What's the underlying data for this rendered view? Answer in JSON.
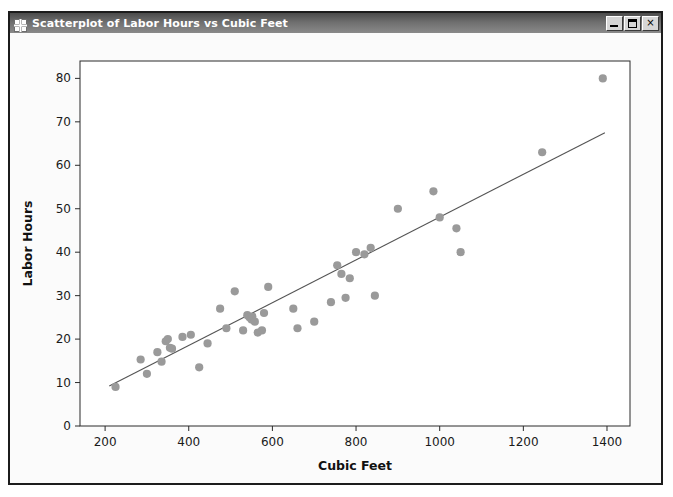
{
  "window": {
    "title": "Scatterplot of Labor Hours vs Cubic Feet",
    "icon": "grid-icon",
    "controls": {
      "minimize_label": "_",
      "maximize_label": "□",
      "close_label": "×"
    },
    "frame_color": "#1c1c1c",
    "titlebar_color": "#6e6e6e",
    "client_color": "#fbfbfb"
  },
  "chart_data": {
    "type": "scatter",
    "title": "Scatter Plot of Labor Hours and Cubic Feet",
    "xlabel": "Cubic Feet",
    "ylabel": "Labor Hours",
    "xlim": [
      140,
      1455
    ],
    "ylim": [
      0,
      84
    ],
    "xticks": [
      200,
      400,
      600,
      800,
      1000,
      1200,
      1400
    ],
    "yticks": [
      0,
      10,
      20,
      30,
      40,
      50,
      60,
      70,
      80
    ],
    "grid": false,
    "legend": null,
    "marker_color": "#9a9a9a",
    "marker_shape": "circle",
    "line_color": "#545454",
    "series": [
      {
        "name": "Labor Hours vs Cubic Feet",
        "x": [
          225,
          285,
          300,
          325,
          335,
          345,
          350,
          355,
          360,
          385,
          405,
          425,
          445,
          475,
          490,
          510,
          530,
          540,
          545,
          550,
          552,
          558,
          565,
          575,
          580,
          590,
          650,
          660,
          700,
          740,
          755,
          765,
          775,
          785,
          800,
          820,
          835,
          845,
          900,
          985,
          1000,
          1040,
          1050,
          1245,
          1390
        ],
        "y": [
          9.0,
          15.3,
          12.0,
          17.0,
          14.8,
          19.5,
          20.0,
          18.0,
          17.8,
          20.5,
          21.0,
          13.5,
          19.0,
          27.0,
          22.5,
          31.0,
          22.0,
          25.5,
          25.0,
          24.5,
          25.2,
          24.0,
          21.5,
          22.0,
          26.0,
          32.0,
          27.0,
          22.5,
          24.0,
          28.5,
          37.0,
          35.0,
          29.5,
          34.0,
          40.0,
          39.5,
          41.0,
          30.0,
          50.0,
          54.0,
          48.0,
          45.5,
          40.0,
          63.0,
          80.0
        ]
      }
    ],
    "fit_line": {
      "name": "regression-line",
      "x_start": 210,
      "y_start": 9.2,
      "x_end": 1395,
      "y_end": 67.5
    }
  }
}
